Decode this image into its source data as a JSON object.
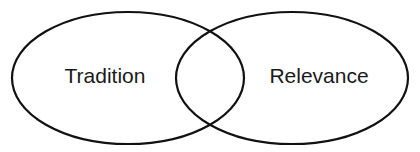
{
  "diagram": {
    "type": "venn-2-set",
    "title": "",
    "canvas": {
      "width": 420,
      "height": 152
    },
    "background_color": "#ffffff",
    "stroke_color": "#111111",
    "stroke_width": 2.2,
    "text_color": "#1a1a1a",
    "sets": [
      {
        "id": "tradition",
        "label": "Tradition",
        "shape": "ellipse",
        "cx": 128,
        "cy": 78,
        "rx": 116,
        "ry": 66,
        "label_x": 105,
        "label_y": 83,
        "fill": "none"
      },
      {
        "id": "relevance",
        "label": "Relevance",
        "shape": "ellipse",
        "cx": 292,
        "cy": 78,
        "rx": 116,
        "ry": 66,
        "label_x": 319,
        "label_y": 83,
        "fill": "none"
      }
    ],
    "intersection": {
      "label": "",
      "center_x": 210,
      "center_y": 78,
      "top_crossing_y": 32,
      "bottom_crossing_y": 125
    }
  }
}
